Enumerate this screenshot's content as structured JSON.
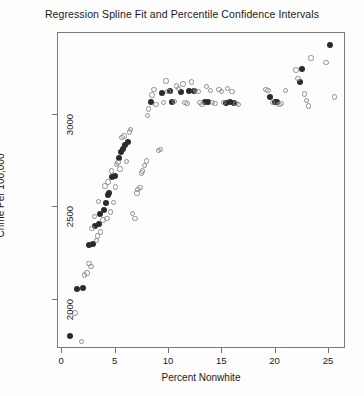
{
  "chart_data": {
    "type": "scatter",
    "title": "Regression Spline Fit and Percentile Confidence Intervals",
    "xlabel": "Percent Nonwhite",
    "ylabel": "Crime Per 100,000",
    "xlim": [
      -0.4,
      26.6
    ],
    "ylim": [
      1735,
      3440
    ],
    "grid": false,
    "legend": null,
    "xticks": [
      0,
      5,
      10,
      15,
      20,
      25
    ],
    "yticks": [
      2000,
      2500,
      3000
    ],
    "xtick_labels": [
      "0",
      "5",
      "10",
      "15",
      "20",
      "25"
    ],
    "ytick_labels": [
      "2000",
      "2500",
      "3000"
    ],
    "series": [
      {
        "name": "Spline fit",
        "marker": "filled-circle",
        "color": "#2b2b2b",
        "points": [
          [
            0.8,
            1800
          ],
          [
            1.5,
            2055
          ],
          [
            2.0,
            2060
          ],
          [
            2.6,
            2290
          ],
          [
            3.0,
            2295
          ],
          [
            3.2,
            2395
          ],
          [
            3.5,
            2405
          ],
          [
            3.6,
            2460
          ],
          [
            4.0,
            2480
          ],
          [
            4.2,
            2520
          ],
          [
            4.4,
            2560
          ],
          [
            4.5,
            2570
          ],
          [
            4.8,
            2655
          ],
          [
            5.0,
            2665
          ],
          [
            5.4,
            2760
          ],
          [
            5.6,
            2790
          ],
          [
            5.8,
            2810
          ],
          [
            6.0,
            2830
          ],
          [
            6.3,
            2845
          ],
          [
            8.4,
            3060
          ],
          [
            9.4,
            3110
          ],
          [
            10.2,
            3120
          ],
          [
            10.4,
            3065
          ],
          [
            11.2,
            3115
          ],
          [
            12.0,
            3120
          ],
          [
            12.4,
            3120
          ],
          [
            13.5,
            3060
          ],
          [
            13.8,
            3060
          ],
          [
            15.4,
            3055
          ],
          [
            15.8,
            3060
          ],
          [
            16.2,
            3055
          ],
          [
            19.6,
            3090
          ],
          [
            20.0,
            3065
          ],
          [
            20.2,
            3065
          ],
          [
            22.4,
            3170
          ],
          [
            22.6,
            3240
          ],
          [
            25.2,
            3370
          ]
        ]
      },
      {
        "name": "Percentile confidence interval bounds",
        "marker": "open-circle",
        "color": "#8e8e8e",
        "points": [
          [
            1.3,
            1925
          ],
          [
            1.9,
            1770
          ],
          [
            2.2,
            2130
          ],
          [
            2.4,
            2140
          ],
          [
            2.6,
            2190
          ],
          [
            2.8,
            2175
          ],
          [
            2.9,
            2380
          ],
          [
            3.1,
            2445
          ],
          [
            3.3,
            2315
          ],
          [
            3.4,
            2340
          ],
          [
            3.5,
            2525
          ],
          [
            3.7,
            2360
          ],
          [
            3.9,
            2425
          ],
          [
            4.1,
            2610
          ],
          [
            4.3,
            2435
          ],
          [
            4.4,
            2630
          ],
          [
            4.6,
            2470
          ],
          [
            4.7,
            2690
          ],
          [
            4.9,
            2520
          ],
          [
            5.1,
            2605
          ],
          [
            5.2,
            2725
          ],
          [
            5.3,
            2735
          ],
          [
            5.5,
            2700
          ],
          [
            5.7,
            2870
          ],
          [
            5.9,
            2880
          ],
          [
            6.1,
            2740
          ],
          [
            6.4,
            2900
          ],
          [
            6.5,
            2915
          ],
          [
            6.7,
            2460
          ],
          [
            6.9,
            2435
          ],
          [
            7.1,
            2570
          ],
          [
            7.2,
            2590
          ],
          [
            7.4,
            2600
          ],
          [
            7.5,
            2680
          ],
          [
            7.6,
            2690
          ],
          [
            7.8,
            2720
          ],
          [
            8.0,
            2745
          ],
          [
            8.1,
            2990
          ],
          [
            8.2,
            3025
          ],
          [
            8.5,
            3100
          ],
          [
            8.7,
            3130
          ],
          [
            8.9,
            3050
          ],
          [
            9.1,
            2800
          ],
          [
            9.3,
            2805
          ],
          [
            9.6,
            3060
          ],
          [
            9.8,
            3175
          ],
          [
            10.0,
            3120
          ],
          [
            10.6,
            3065
          ],
          [
            10.8,
            3150
          ],
          [
            11.0,
            3135
          ],
          [
            11.4,
            3160
          ],
          [
            11.6,
            3060
          ],
          [
            11.8,
            3055
          ],
          [
            12.2,
            3170
          ],
          [
            12.6,
            3125
          ],
          [
            12.8,
            3120
          ],
          [
            13.0,
            3060
          ],
          [
            13.2,
            3050
          ],
          [
            13.6,
            3145
          ],
          [
            14.0,
            3125
          ],
          [
            14.2,
            3060
          ],
          [
            14.4,
            3055
          ],
          [
            14.8,
            3130
          ],
          [
            15.0,
            3120
          ],
          [
            15.2,
            3060
          ],
          [
            15.6,
            3135
          ],
          [
            16.0,
            3120
          ],
          [
            16.4,
            3055
          ],
          [
            16.6,
            3050
          ],
          [
            19.2,
            3130
          ],
          [
            19.4,
            3125
          ],
          [
            19.8,
            3060
          ],
          [
            20.4,
            3050
          ],
          [
            20.6,
            3055
          ],
          [
            21.0,
            3125
          ],
          [
            22.0,
            3235
          ],
          [
            22.2,
            3190
          ],
          [
            22.8,
            3105
          ],
          [
            23.0,
            3070
          ],
          [
            23.2,
            3040
          ],
          [
            23.4,
            3300
          ],
          [
            24.8,
            3275
          ],
          [
            25.6,
            3090
          ]
        ]
      }
    ]
  }
}
